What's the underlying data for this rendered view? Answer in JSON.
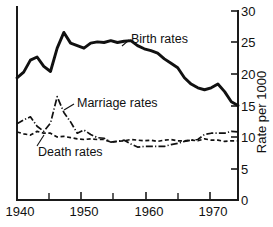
{
  "chart_data": {
    "type": "line",
    "title": "",
    "xlabel": "",
    "ylabel": "Rate per 1000",
    "xlim": [
      1940,
      1973
    ],
    "ylim": [
      0,
      30
    ],
    "grid": false,
    "legend_position": "inline-annotations",
    "x_ticks": [
      1940,
      1945,
      1950,
      1955,
      1960,
      1965,
      1970
    ],
    "x_tick_labels": [
      "1940",
      "",
      "1950",
      "",
      "1960",
      "",
      "1970"
    ],
    "y_ticks": [
      0,
      5,
      10,
      15,
      20,
      25,
      30
    ],
    "y_tick_labels": [
      "0",
      "5",
      "10",
      "15",
      "20",
      "25",
      "30"
    ],
    "y_axis_side": "right",
    "annotations": [
      {
        "text": "Birth rates",
        "series": "birth"
      },
      {
        "text": "Marriage rates",
        "series": "marriage"
      },
      {
        "text": "Death rates",
        "series": "death"
      }
    ],
    "x": [
      1940,
      1941,
      1942,
      1943,
      1944,
      1945,
      1946,
      1947,
      1948,
      1949,
      1950,
      1951,
      1952,
      1953,
      1954,
      1955,
      1956,
      1957,
      1958,
      1959,
      1960,
      1961,
      1962,
      1963,
      1964,
      1965,
      1966,
      1967,
      1968,
      1969,
      1970,
      1971,
      1972,
      1973
    ],
    "series": [
      {
        "name": "Birth rates",
        "style": "solid",
        "values": [
          19.4,
          20.3,
          22.2,
          22.7,
          21.2,
          20.4,
          24.1,
          26.6,
          24.9,
          24.5,
          24.1,
          24.9,
          25.1,
          25.0,
          25.3,
          25.0,
          25.2,
          25.3,
          24.5,
          24.0,
          23.7,
          23.3,
          22.4,
          21.7,
          21.0,
          19.4,
          18.4,
          17.8,
          17.5,
          17.8,
          18.4,
          17.2,
          15.6,
          15.0
        ]
      },
      {
        "name": "Marriage rates",
        "style": "dash-dot",
        "values": [
          12.1,
          12.7,
          13.2,
          11.7,
          10.9,
          12.2,
          16.4,
          13.9,
          12.4,
          10.6,
          11.1,
          10.4,
          9.9,
          9.8,
          9.2,
          9.3,
          9.5,
          8.9,
          8.4,
          8.5,
          8.5,
          8.5,
          8.5,
          8.8,
          9.0,
          9.3,
          9.5,
          9.6,
          10.4,
          10.6,
          10.6,
          10.6,
          10.9,
          10.8
        ]
      },
      {
        "name": "Death rates",
        "style": "dashed",
        "values": [
          10.8,
          10.5,
          10.3,
          10.9,
          10.6,
          10.6,
          10.0,
          10.1,
          9.9,
          9.7,
          9.6,
          9.7,
          9.6,
          9.6,
          9.2,
          9.3,
          9.4,
          9.6,
          9.5,
          9.4,
          9.5,
          9.3,
          9.5,
          9.6,
          9.4,
          9.4,
          9.5,
          9.4,
          9.7,
          9.5,
          9.5,
          9.3,
          9.4,
          9.4
        ]
      }
    ]
  },
  "labels": {
    "birth": "Birth rates",
    "marriage": "Marriage rates",
    "death": "Death rates",
    "y_axis_title": "Rate per 1000",
    "x_1940": "1940",
    "x_1950": "1950",
    "x_1960": "1960",
    "x_1970": "1970",
    "y_0": "0",
    "y_5": "5",
    "y_10": "10",
    "y_15": "15",
    "y_20": "20",
    "y_25": "25",
    "y_30": "30"
  }
}
